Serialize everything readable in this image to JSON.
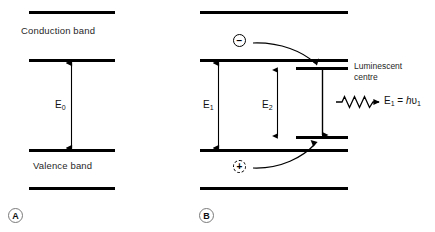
{
  "figure": {
    "background_color": "#ffffff",
    "line_color": "#000000",
    "panels": [
      {
        "tag": "A",
        "conduction_band_label": "Conduction band",
        "valence_band_label": "Valence band",
        "transition_label": "E",
        "transition_sub": "0"
      },
      {
        "tag": "B",
        "conduction_band_label": "",
        "valence_band_label": "",
        "centre_label_line1": "Luminescent",
        "centre_label_line2": "centre",
        "transition1_label": "E",
        "transition1_sub": "1",
        "transition2_label": "E",
        "transition2_sub": "2",
        "emission_formula": {
          "lhs": "E",
          "lhs_sub": "1",
          "equals": " = ",
          "planck": "h",
          "nu": "υ",
          "nu_sub": "1"
        },
        "electron_symbol": "−",
        "hole_symbol": "+"
      }
    ]
  }
}
